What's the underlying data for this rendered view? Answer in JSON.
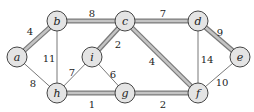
{
  "graph": {
    "nodes": [
      {
        "id": "a",
        "label": "a",
        "x": 17,
        "y": 57
      },
      {
        "id": "b",
        "label": "b",
        "x": 57,
        "y": 21
      },
      {
        "id": "c",
        "label": "c",
        "x": 125,
        "y": 21
      },
      {
        "id": "d",
        "label": "d",
        "x": 198,
        "y": 21
      },
      {
        "id": "e",
        "label": "e",
        "x": 240,
        "y": 57
      },
      {
        "id": "f",
        "label": "f",
        "x": 198,
        "y": 93
      },
      {
        "id": "g",
        "label": "g",
        "x": 125,
        "y": 93
      },
      {
        "id": "h",
        "label": "h",
        "x": 57,
        "y": 93
      },
      {
        "id": "i",
        "label": "i",
        "x": 92,
        "y": 57
      }
    ],
    "edges": [
      {
        "from": "a",
        "to": "b",
        "weight": "4",
        "mst": true,
        "lx": 30,
        "ly": 31
      },
      {
        "from": "b",
        "to": "c",
        "weight": "8",
        "mst": true,
        "lx": 92,
        "ly": 13
      },
      {
        "from": "c",
        "to": "d",
        "weight": "7",
        "mst": true,
        "lx": 163,
        "ly": 13
      },
      {
        "from": "d",
        "to": "e",
        "weight": "9",
        "mst": true,
        "lx": 220,
        "ly": 32
      },
      {
        "from": "c",
        "to": "i",
        "weight": "2",
        "mst": true,
        "lx": 118,
        "ly": 44
      },
      {
        "from": "c",
        "to": "f",
        "weight": "4",
        "mst": true,
        "lx": 152,
        "ly": 61
      },
      {
        "from": "h",
        "to": "g",
        "weight": "1",
        "mst": true,
        "lx": 92,
        "ly": 104
      },
      {
        "from": "g",
        "to": "f",
        "weight": "2",
        "mst": true,
        "lx": 163,
        "ly": 104
      },
      {
        "from": "a",
        "to": "h",
        "weight": "8",
        "mst": false,
        "lx": 33,
        "ly": 83
      },
      {
        "from": "b",
        "to": "h",
        "weight": "11",
        "mst": false,
        "lx": 49,
        "ly": 58
      },
      {
        "from": "i",
        "to": "h",
        "weight": "7",
        "mst": false,
        "lx": 72,
        "ly": 72
      },
      {
        "from": "i",
        "to": "g",
        "weight": "6",
        "mst": false,
        "lx": 113,
        "ly": 74
      },
      {
        "from": "d",
        "to": "f",
        "weight": "14",
        "mst": false,
        "lx": 207,
        "ly": 59
      },
      {
        "from": "e",
        "to": "f",
        "weight": "10",
        "mst": false,
        "lx": 222,
        "ly": 82
      }
    ],
    "colors": {
      "mst_edge": "#9a9a9a",
      "plain_edge": "#555555",
      "node_fill": "#e4e4e4"
    }
  }
}
